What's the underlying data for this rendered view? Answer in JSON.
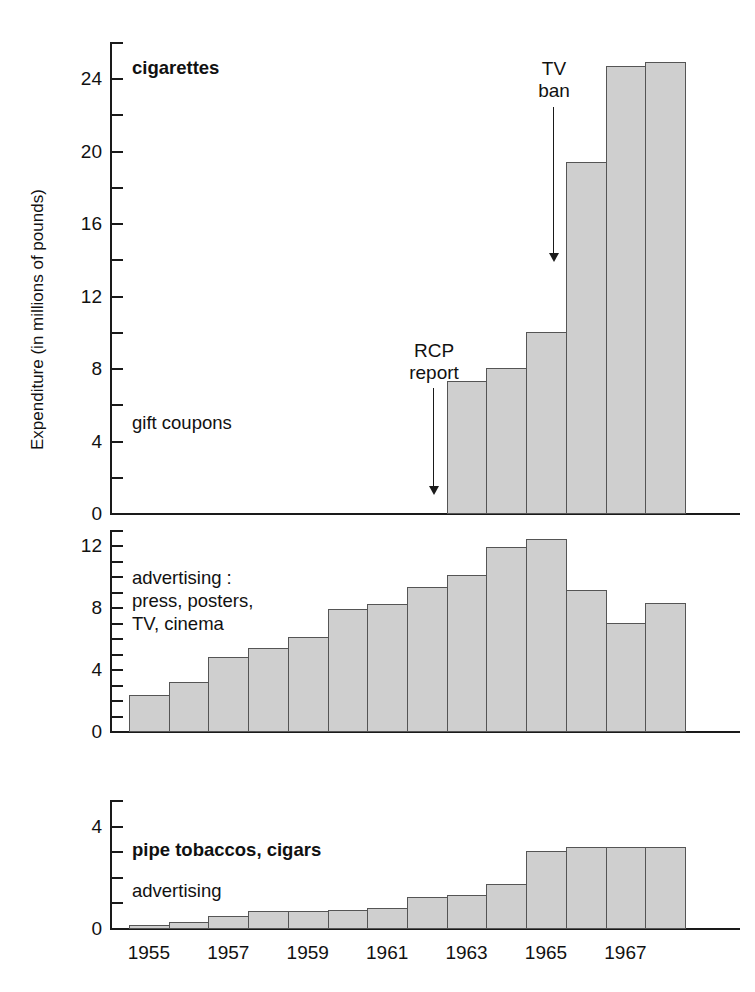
{
  "axis_title": "Expenditure (in millions of pounds)",
  "x_axis": {
    "tick_labels": [
      "1955",
      "1957",
      "1959",
      "1961",
      "1963",
      "1965",
      "1967"
    ],
    "all_years": [
      1955,
      1956,
      1957,
      1958,
      1959,
      1960,
      1961,
      1962,
      1963,
      1964,
      1965,
      1966,
      1967,
      1968
    ]
  },
  "panels": {
    "top": {
      "label_main": "cigarettes",
      "label_sub": "gift coupons",
      "y_labels": [
        "24",
        "20",
        "16",
        "12",
        "8",
        "4",
        "0"
      ],
      "annotations": [
        {
          "name": "rcp-report",
          "line1": "RCP",
          "line2": "report"
        },
        {
          "name": "tv-ban",
          "line1": "TV",
          "line2": "ban"
        }
      ]
    },
    "middle": {
      "label": "advertising :\npress, posters,\nTV, cinema",
      "y_labels": [
        "12",
        "8",
        "4",
        "0"
      ]
    },
    "bottom": {
      "label_main": "pipe tobaccos, cigars",
      "label_sub": "advertising",
      "y_labels": [
        "4",
        "0"
      ]
    }
  },
  "colors": {
    "bar_fill": "#cfcfcf",
    "bar_stroke": "#555555",
    "axis": "#1a1a1a",
    "text": "#111111",
    "background": "#ffffff"
  },
  "chart_data": [
    {
      "type": "bar",
      "name": "cigarettes-gift-coupons",
      "title": "cigarettes / gift coupons",
      "xlabel": "",
      "ylabel": "Expenditure (in millions of pounds)",
      "ylim": [
        0,
        26
      ],
      "ytick_step": 2,
      "ytick_labeled": [
        0,
        4,
        8,
        12,
        16,
        20,
        24
      ],
      "grid": false,
      "categories": [
        "1955",
        "1956",
        "1957",
        "1958",
        "1959",
        "1960",
        "1961",
        "1962",
        "1963",
        "1964",
        "1965",
        "1966",
        "1967",
        "1968"
      ],
      "values": [
        0,
        0,
        0,
        0,
        0,
        0,
        0,
        0,
        7.3,
        8.0,
        10.0,
        19.4,
        24.7,
        24.9
      ],
      "annotations": [
        {
          "text": "RCP report",
          "at_category": "1963",
          "kind": "arrow-down"
        },
        {
          "text": "TV ban",
          "at_category": "1965",
          "kind": "arrow-down"
        }
      ]
    },
    {
      "type": "bar",
      "name": "advertising-press-posters-tv-cinema",
      "title": "advertising : press, posters, TV, cinema",
      "xlabel": "",
      "ylabel": "",
      "ylim": [
        0,
        13
      ],
      "ytick_step": 1,
      "ytick_labeled": [
        0,
        4,
        8,
        12
      ],
      "grid": false,
      "categories": [
        "1955",
        "1956",
        "1957",
        "1958",
        "1959",
        "1960",
        "1961",
        "1962",
        "1963",
        "1964",
        "1965",
        "1966",
        "1967",
        "1968"
      ],
      "values": [
        2.3,
        3.2,
        4.8,
        5.4,
        6.1,
        7.9,
        8.2,
        9.3,
        10.1,
        11.9,
        12.4,
        9.1,
        7.0,
        8.3
      ]
    },
    {
      "type": "bar",
      "name": "pipe-tobaccos-cigars-advertising",
      "title": "pipe tobaccos, cigars — advertising",
      "xlabel": "",
      "ylabel": "",
      "ylim": [
        0,
        5
      ],
      "ytick_step": 1,
      "ytick_labeled": [
        0,
        4
      ],
      "grid": false,
      "categories": [
        "1955",
        "1956",
        "1957",
        "1958",
        "1959",
        "1960",
        "1961",
        "1962",
        "1963",
        "1964",
        "1965",
        "1966",
        "1967",
        "1968"
      ],
      "values": [
        0.1,
        0.25,
        0.45,
        0.65,
        0.65,
        0.7,
        0.8,
        1.2,
        1.3,
        1.7,
        3.0,
        3.15,
        3.15,
        3.15
      ]
    }
  ]
}
